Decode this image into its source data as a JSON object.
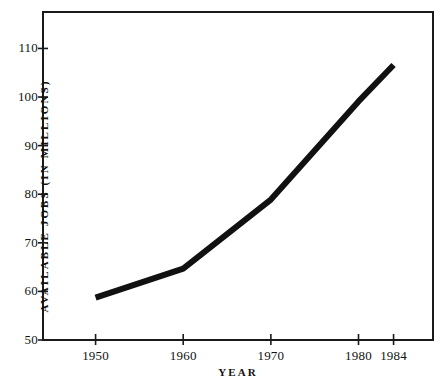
{
  "chart_data": {
    "type": "line",
    "title": "",
    "xlabel": "YEAR",
    "ylabel": "AVAILABLE JOBS (IN MILLIONS)",
    "x": [
      1950,
      1960,
      1970,
      1980,
      1984
    ],
    "values": [
      58.7,
      64.7,
      78.9,
      99.1,
      106.6
    ],
    "series": [
      {
        "name": "Available jobs",
        "values": [
          58.7,
          64.7,
          78.9,
          99.1,
          106.6
        ],
        "color": "#111111"
      }
    ],
    "xtick_labels": [
      "1950",
      "1960",
      "1970",
      "1980",
      "1984"
    ],
    "xtick_values": [
      1950,
      1960,
      1970,
      1980,
      1984
    ],
    "ytick_labels": [
      "50",
      "60",
      "70",
      "80",
      "90",
      "100",
      "110"
    ],
    "ytick_values": [
      50,
      60,
      70,
      80,
      90,
      100,
      110
    ],
    "xlim": [
      1944,
      1988.5
    ],
    "ylim": [
      50,
      117.5
    ],
    "grid": false,
    "legend": false,
    "legend_position": "none",
    "line_color": "#111111",
    "line_width": 6,
    "frame_color": "#1a1a1a",
    "background_color": "#ffffff",
    "annotations": []
  },
  "axes": {
    "y_title": "AVAILABLE JOBS (IN MILLIONS)",
    "x_title": "YEAR",
    "y_ticks": [
      {
        "label": "110",
        "value": 110
      },
      {
        "label": "100",
        "value": 100
      },
      {
        "label": "90",
        "value": 90
      },
      {
        "label": "80",
        "value": 80
      },
      {
        "label": "70",
        "value": 70
      },
      {
        "label": "60",
        "value": 60
      },
      {
        "label": "50",
        "value": 50
      }
    ],
    "x_ticks": [
      {
        "label": "1950",
        "value": 1950
      },
      {
        "label": "1960",
        "value": 1960
      },
      {
        "label": "1970",
        "value": 1970
      },
      {
        "label": "1980",
        "value": 1980
      },
      {
        "label": "1984",
        "value": 1984
      }
    ]
  }
}
